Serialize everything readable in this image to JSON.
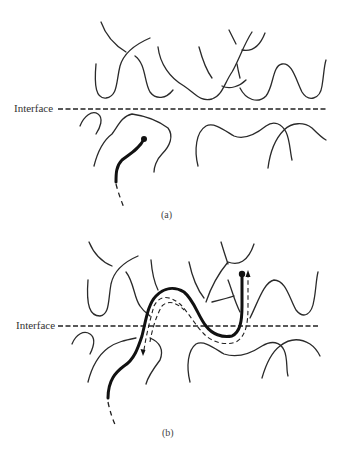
{
  "figure": {
    "panels": [
      {
        "id": "a",
        "caption": "(a)",
        "interface_label": "Interface",
        "description": "Polymer chain end approaching interface; chain remains below interface"
      },
      {
        "id": "b",
        "caption": "(b)",
        "interface_label": "Interface",
        "description": "Chain has reptated across the interface into the upper layer; dashed tube with arrows shows reptation path"
      }
    ],
    "colors": {
      "background": "#ffffff",
      "line": "#2a2a2a",
      "probe_chain": "#111111"
    }
  }
}
